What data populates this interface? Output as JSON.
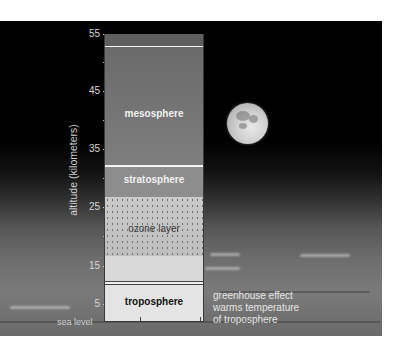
{
  "diagram": {
    "axis": {
      "title": "altitude (kilometers)",
      "ticks": [
        "55",
        "45",
        "35",
        "25",
        "15",
        "5"
      ],
      "baseline_label": "sea level"
    },
    "layers": {
      "mesosphere": "mesosphere",
      "stratosphere": "stratosphere",
      "ozone": "ozone layer",
      "troposphere": "troposphere"
    },
    "annotation": {
      "line1": "greenhouse effect",
      "line2": "warms temperature",
      "line3": "of troposphere"
    },
    "background_scene": "earth-horizon-with-moon",
    "colors": {
      "sky": "#000000",
      "column_mesosphere": "#747474",
      "column_stratosphere": "#8d8d8d",
      "column_ozone": "#c9c9c9",
      "column_troposphere": "#e4e4e4"
    }
  }
}
